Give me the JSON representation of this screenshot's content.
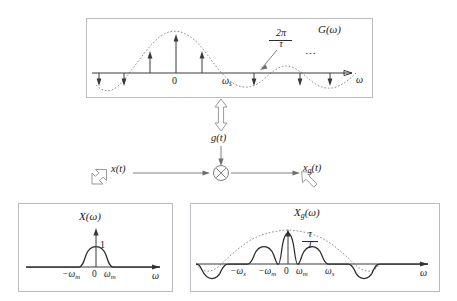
{
  "diagram": {
    "type": "signal-processing-block-diagram"
  },
  "top_box": {
    "name": "pulse-train-spectrum",
    "plot_label": "G(ω)",
    "axis_label": "ω",
    "origin_label": "0",
    "tick_labels": [
      "0",
      "ω"
    ],
    "sampling_freq_label": "ω",
    "sampling_freq_sub": "s",
    "spacing_annotation": {
      "numerator": "2π",
      "denominator": "τ"
    },
    "ellipsis": "⋯",
    "description": "Impulse train weighted by a sinc envelope; impulses invert below axis where envelope is negative."
  },
  "middle": {
    "carrier_label": "g(t)",
    "input_label": "x(t)",
    "output_label": "x",
    "output_sub": "g",
    "output_tail": "(t)",
    "multiplier_symbol": "⊗",
    "multiplier_name": "multiplier-node"
  },
  "bottom_left_box": {
    "name": "baseband-spectrum",
    "plot_label": "X(ω)",
    "amplitude_label": "1",
    "axis_label": "ω",
    "origin_label": "0",
    "neg_cutoff": "−ω",
    "neg_cutoff_sub": "m",
    "pos_cutoff": "ω",
    "pos_cutoff_sub": "m"
  },
  "bottom_right_box": {
    "name": "sampled-spectrum",
    "plot_label_base": "X",
    "plot_label_sub": "g",
    "plot_label_tail": "(ω)",
    "amplitude_fraction": {
      "numerator": "τ",
      "denominator": "T"
    },
    "axis_label": "ω",
    "origin_label": "0",
    "ticks": [
      {
        "base": "−ω",
        "sub": "s"
      },
      {
        "base": "−ω",
        "sub": "m"
      },
      {
        "base": "0",
        "sub": ""
      },
      {
        "base": "ω",
        "sub": "m"
      },
      {
        "base": "ω",
        "sub": "s"
      }
    ],
    "description": "Replicas of X(ω) at multiples of ωs, scaled by a sinc envelope; replicas invert where envelope is negative."
  },
  "arrows": {
    "carrier_transform": "double-headed-vertical-hollow-arrow",
    "input_transform": "double-headed-diagonal-hollow-arrow",
    "output_transform": "down-hollow-arrow"
  },
  "colors": {
    "ink": "#2b2b2b",
    "axis": "#3a3a3a",
    "envelope": "#8e8e8e",
    "box_border": "#b9bcc0",
    "hollow_arrow_fill": "#ffffff",
    "hollow_arrow_stroke": "#9a9a9a",
    "background": "#ffffff"
  }
}
